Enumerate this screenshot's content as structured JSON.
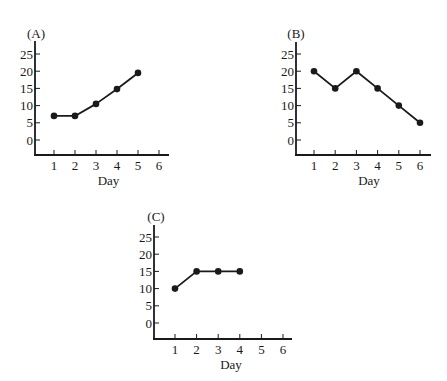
{
  "figure": {
    "background": "#ffffff",
    "ink_color": "#1a1a1a"
  },
  "chart_data": [
    {
      "type": "line",
      "panel_label": "(A)",
      "title": "",
      "xlabel": "Day",
      "ylabel": "",
      "x_ticks": [
        "1",
        "2",
        "3",
        "4",
        "5",
        "6"
      ],
      "y_ticks": [
        "0",
        "5",
        "10",
        "15",
        "20",
        "25"
      ],
      "xlim": [
        0,
        6.5
      ],
      "ylim": [
        -4,
        27
      ],
      "grid": false,
      "legend": null,
      "series": [
        {
          "name": "A",
          "x": [
            1,
            2,
            3,
            4,
            5
          ],
          "values": [
            7,
            7,
            10.5,
            14.8,
            19.5
          ]
        }
      ],
      "layout": {
        "origin_x": 35,
        "axis_y": 155,
        "axis_top": 41,
        "axis_right": 169,
        "x_unit": 21,
        "x_first": 54,
        "y_zero": 140,
        "y_per_5": 17.2,
        "label_x": 36,
        "label_y": 38
      }
    },
    {
      "type": "line",
      "panel_label": "(B)",
      "title": "",
      "xlabel": "Day",
      "ylabel": "",
      "x_ticks": [
        "1",
        "2",
        "3",
        "4",
        "5",
        "6"
      ],
      "y_ticks": [
        "0",
        "5",
        "10",
        "15",
        "20",
        "25"
      ],
      "xlim": [
        0,
        6.5
      ],
      "ylim": [
        -4,
        27
      ],
      "grid": false,
      "legend": null,
      "series": [
        {
          "name": "B",
          "x": [
            1,
            2,
            3,
            4,
            5,
            6
          ],
          "values": [
            20,
            15,
            20,
            15,
            10,
            5
          ]
        }
      ],
      "layout": {
        "origin_x": 296,
        "axis_y": 155,
        "axis_top": 42,
        "axis_right": 431,
        "x_unit": 21.2,
        "x_first": 314,
        "y_zero": 140,
        "y_per_5": 17.2,
        "label_x": 296,
        "label_y": 38
      }
    },
    {
      "type": "line",
      "panel_label": "(C)",
      "title": "",
      "xlabel": "Day",
      "ylabel": "",
      "x_ticks": [
        "1",
        "2",
        "3",
        "4",
        "5",
        "6"
      ],
      "y_ticks": [
        "0",
        "5",
        "10",
        "15",
        "20",
        "25"
      ],
      "xlim": [
        0,
        6.5
      ],
      "ylim": [
        -4,
        27
      ],
      "grid": false,
      "legend": null,
      "series": [
        {
          "name": "C",
          "x": [
            1,
            2,
            3,
            4
          ],
          "values": [
            10,
            15,
            15,
            15
          ]
        }
      ],
      "layout": {
        "origin_x": 154,
        "axis_y": 339,
        "axis_top": 225,
        "axis_right": 292,
        "x_unit": 21.6,
        "x_first": 175,
        "y_zero": 323,
        "y_per_5": 17.2,
        "label_x": 156,
        "label_y": 221
      }
    }
  ]
}
